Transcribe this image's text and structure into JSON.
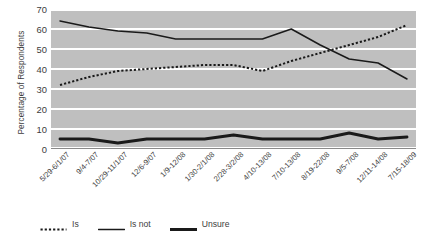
{
  "chart_data": {
    "type": "line",
    "title": "",
    "xlabel": "",
    "ylabel": "Percentage of Respondents",
    "ylim": [
      0,
      70
    ],
    "ytick_step": 10,
    "yticks": [
      0,
      10,
      20,
      30,
      40,
      50,
      60,
      70
    ],
    "grid": true,
    "legend_position": "bottom",
    "plot_background": "#bfbfbf",
    "gridline_color": "#ffffff",
    "series_color": "#1a1a1a",
    "categories": [
      "5/29-6/1/07",
      "9/4-7/07",
      "10/29-11/1/07",
      "12/6-9/07",
      "1/9-12/08",
      "1/30-2/1/08",
      "2/28-3/2/08",
      "4/10-13/08",
      "7/10-13/08",
      "8/19-22/08",
      "9/5-7/08",
      "12/11-14/08",
      "7/15-18/09"
    ],
    "series": [
      {
        "name": "Is",
        "style": "dotted",
        "values": [
          32,
          36,
          39,
          40,
          41,
          42,
          42,
          39,
          44,
          48,
          52,
          56,
          62
        ]
      },
      {
        "name": "Is not",
        "style": "solid-thin",
        "values": [
          64,
          61,
          59,
          58,
          55,
          55,
          55,
          55,
          60,
          52,
          45,
          43,
          35
        ]
      },
      {
        "name": "Unsure",
        "style": "solid-thick",
        "values": [
          5,
          5,
          3,
          5,
          5,
          5,
          7,
          5,
          5,
          5,
          8,
          5,
          6
        ]
      }
    ]
  },
  "legend": {
    "items": [
      {
        "label": "Is",
        "style": "dotted"
      },
      {
        "label": "Is not",
        "style": "solid-thin"
      },
      {
        "label": "Unsure",
        "style": "solid-thick"
      }
    ]
  }
}
